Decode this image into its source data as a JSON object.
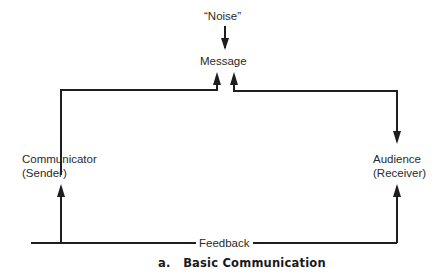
{
  "diagram": {
    "title": "Basic Communication",
    "caption_prefix": "a.",
    "caption": "a.   Basic Communication",
    "nodes": {
      "noise": "“Noise”",
      "message": "Message",
      "communicator": "Communicator",
      "communicator_sub": "(Sender)",
      "audience": "Audience",
      "audience_sub": "(Receiver)",
      "feedback": "Feedback"
    },
    "edges": [
      {
        "from": "Noise",
        "to": "Message",
        "direction": "down"
      },
      {
        "from": "Communicator",
        "to": "Message",
        "direction": "up"
      },
      {
        "from": "Message",
        "to": "Audience",
        "direction": "down"
      },
      {
        "from": "Audience",
        "to": "Communicator",
        "via": "Feedback",
        "direction": "up"
      }
    ],
    "colors": {
      "line": "#1e1e1e",
      "text": "#2a2a2a",
      "background": "#ffffff"
    }
  }
}
